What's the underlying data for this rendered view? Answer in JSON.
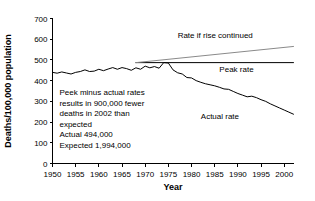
{
  "chart_data": {
    "type": "line",
    "title": "",
    "xlabel": "Year",
    "ylabel": "Deaths/100,000 population",
    "xlim": [
      1950,
      2002
    ],
    "ylim": [
      0,
      700
    ],
    "xticks": [
      1950,
      1955,
      1960,
      1965,
      1970,
      1975,
      1980,
      1985,
      1990,
      1995,
      2000
    ],
    "xtick_labels": [
      "1950",
      "1955",
      "1960",
      "1965",
      "1970",
      "1975",
      "1980",
      "1985",
      "1990",
      "1995",
      "2000"
    ],
    "yticks": [
      0,
      100,
      200,
      300,
      400,
      500,
      600,
      700
    ],
    "ytick_labels": [
      "0",
      "100",
      "200",
      "300",
      "400",
      "500",
      "600",
      "700"
    ],
    "grid": false,
    "legend_position": "inline-labels",
    "series": [
      {
        "name": "Actual rate",
        "color": "#000000",
        "label": "Actual rate",
        "label_x": 1982,
        "label_y": 215,
        "x": [
          1950,
          1951,
          1952,
          1953,
          1954,
          1955,
          1956,
          1957,
          1958,
          1959,
          1960,
          1961,
          1962,
          1963,
          1964,
          1965,
          1966,
          1967,
          1968,
          1969,
          1970,
          1971,
          1972,
          1973,
          1974,
          1975,
          1976,
          1977,
          1978,
          1979,
          1980,
          1981,
          1982,
          1983,
          1984,
          1985,
          1986,
          1987,
          1988,
          1989,
          1990,
          1991,
          1992,
          1993,
          1994,
          1995,
          1996,
          1997,
          1998,
          1999,
          2000,
          2001,
          2002
        ],
        "values": [
          440,
          436,
          442,
          437,
          432,
          440,
          444,
          452,
          444,
          446,
          455,
          448,
          456,
          463,
          455,
          463,
          458,
          450,
          462,
          455,
          470,
          462,
          468,
          460,
          487,
          485,
          452,
          438,
          432,
          415,
          413,
          400,
          392,
          385,
          380,
          375,
          368,
          360,
          358,
          348,
          338,
          330,
          322,
          325,
          318,
          308,
          300,
          288,
          278,
          268,
          258,
          248,
          238
        ],
        "style": "solid"
      },
      {
        "name": "Peak rate",
        "color": "#000000",
        "label": "Peak rate",
        "label_x": 1986,
        "label_y": 442,
        "x": [
          1968,
          2002
        ],
        "values": [
          487,
          487
        ],
        "style": "solid"
      },
      {
        "name": "Rate if rise continued",
        "color": "#8a8a8a",
        "label": "Rate if rise continued",
        "label_x": 1977,
        "label_y": 608,
        "x": [
          1968,
          2002
        ],
        "values": [
          487,
          565
        ],
        "style": "solid"
      }
    ],
    "annotations": [
      {
        "name": "summary-note",
        "x": 1951.5,
        "y": 330,
        "lines": [
          "Peek minus actual rates",
          "results in 900,000 fewer",
          "deaths in 2002 than",
          "expected",
          "Actual 494,000",
          "Expected 1,994,000"
        ]
      }
    ]
  }
}
